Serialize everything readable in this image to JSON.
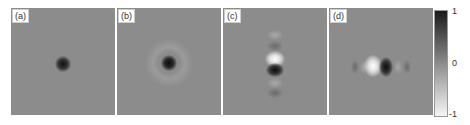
{
  "figure": {
    "panels": [
      {
        "label": "(a)"
      },
      {
        "label": "(b)"
      },
      {
        "label": "(c)"
      },
      {
        "label": "(d)"
      }
    ],
    "colorbar": {
      "ticks": [
        "1",
        "0",
        "-1"
      ],
      "top_color": "#1a1a1a",
      "mid_color": "#8c8c8c",
      "bottom_color": "#f5f5f5"
    }
  }
}
